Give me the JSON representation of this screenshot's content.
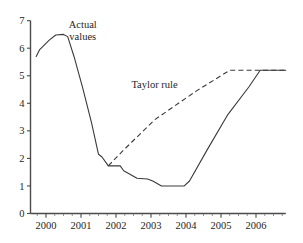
{
  "chart_data": {
    "type": "line",
    "title": "",
    "subtitle": "",
    "xlabel": "",
    "ylabel": "",
    "xlim": [
      1999.7,
      2006.85
    ],
    "ylim": [
      0,
      7
    ],
    "grid": false,
    "legend_position": "inline-annotations",
    "y_ticks": [
      "0",
      "1",
      "2",
      "3",
      "4",
      "5",
      "6",
      "7"
    ],
    "y_tick_values": [
      0,
      1,
      2,
      3,
      4,
      5,
      6,
      7
    ],
    "x_ticks": [
      "2000",
      "2001",
      "2002",
      "2003",
      "2004",
      "2005",
      "2006"
    ],
    "x_tick_values": [
      2000,
      2001,
      2002,
      2003,
      2004,
      2005,
      2006
    ],
    "x_minor_step": 0.25,
    "annotations": [
      {
        "name": "actual-values-label",
        "text_line1": "Actual",
        "text_line2": "values",
        "x": 2001.05,
        "y": 6.75
      },
      {
        "name": "taylor-rule-label",
        "text": "Taylor rule",
        "x": 2003.1,
        "y": 4.55
      }
    ],
    "series": [
      {
        "name": "Actual values",
        "style": "solid",
        "color": "#3a3a3a",
        "points": [
          [
            1999.72,
            5.7
          ],
          [
            1999.82,
            5.95
          ],
          [
            2000.1,
            6.3
          ],
          [
            2000.28,
            6.48
          ],
          [
            2000.5,
            6.5
          ],
          [
            2000.62,
            6.42
          ],
          [
            2000.8,
            5.7
          ],
          [
            2001.05,
            4.55
          ],
          [
            2001.3,
            3.3
          ],
          [
            2001.5,
            2.15
          ],
          [
            2001.6,
            2.05
          ],
          [
            2001.78,
            1.73
          ],
          [
            2002.05,
            1.73
          ],
          [
            2002.12,
            1.73
          ],
          [
            2002.22,
            1.55
          ],
          [
            2002.6,
            1.28
          ],
          [
            2002.9,
            1.25
          ],
          [
            2003.05,
            1.18
          ],
          [
            2003.3,
            1.0
          ],
          [
            2003.95,
            1.0
          ],
          [
            2004.1,
            1.18
          ],
          [
            2004.6,
            2.3
          ],
          [
            2005.2,
            3.6
          ],
          [
            2005.8,
            4.6
          ],
          [
            2006.12,
            5.2
          ],
          [
            2006.85,
            5.2
          ]
        ]
      },
      {
        "name": "Taylor rule",
        "style": "dashed",
        "color": "#3a3a3a",
        "points": [
          [
            2001.78,
            1.73
          ],
          [
            2002.2,
            2.28
          ],
          [
            2003.1,
            3.4
          ],
          [
            2004.3,
            4.45
          ],
          [
            2005.25,
            5.2
          ],
          [
            2006.85,
            5.2
          ]
        ]
      }
    ]
  }
}
